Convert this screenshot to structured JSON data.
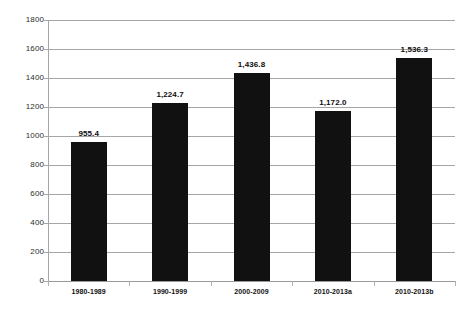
{
  "chart_data": {
    "type": "bar",
    "title": "",
    "subtitle": "",
    "xlabel": "",
    "ylabel": "",
    "categories": [
      "1980-1989",
      "1990-1999",
      "2000-2009",
      "2010-2013a",
      "2010-2013b"
    ],
    "values": [
      955.4,
      1224.7,
      1436.8,
      1172.0,
      1536.3
    ],
    "value_labels": [
      "955.4",
      "1,224.7",
      "1,436.8",
      "1,172.0",
      "1,536.3"
    ],
    "series": [
      {
        "name": "",
        "values": [
          955.4,
          1224.7,
          1436.8,
          1172.0,
          1536.3
        ]
      }
    ],
    "ylim": [
      0,
      1800
    ],
    "y_ticks": [
      0,
      200,
      400,
      600,
      800,
      1000,
      1200,
      1400,
      1600,
      1800
    ],
    "y_tick_labels": [
      "0",
      "200",
      "400",
      "600",
      "800",
      "1000",
      "1200",
      "1400",
      "1600",
      "1800"
    ],
    "grid": true,
    "grid_axis": "y",
    "legend": false,
    "legend_position": "none",
    "bar_color": "#111111",
    "grid_color": "#a6a6a6",
    "background_color": "#ffffff",
    "text_color": "#111111",
    "annotations": []
  }
}
